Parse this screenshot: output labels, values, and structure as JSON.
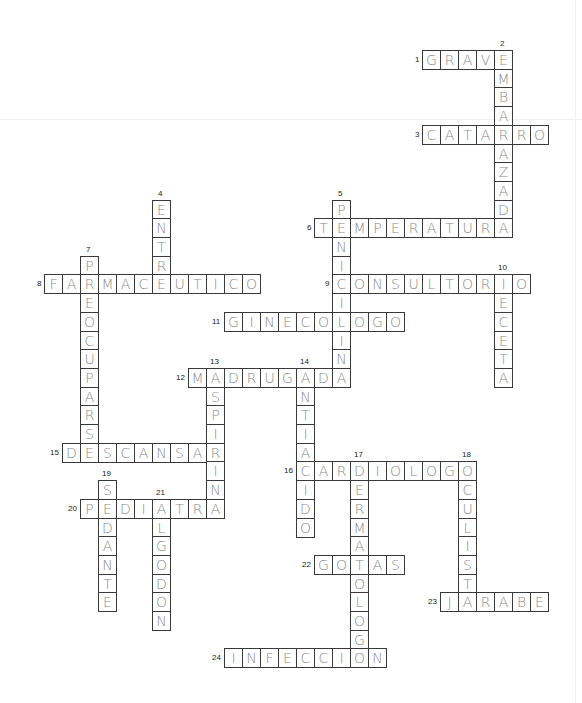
{
  "puzzle": {
    "title": "Crossword",
    "grid": {
      "origin_x": 44,
      "origin_y": 50,
      "cell_w": 18,
      "cell_h": 18.7
    },
    "words": [
      {
        "number": 1,
        "direction": "across",
        "row": 0,
        "col": 21,
        "answer": "GRAVE"
      },
      {
        "number": 2,
        "direction": "down",
        "row": 0,
        "col": 25,
        "answer": "EMBARAZADA"
      },
      {
        "number": 3,
        "direction": "across",
        "row": 4,
        "col": 21,
        "answer": "CATARRO"
      },
      {
        "number": 4,
        "direction": "down",
        "row": 8,
        "col": 6,
        "answer": "ENTRE"
      },
      {
        "number": 5,
        "direction": "down",
        "row": 8,
        "col": 16,
        "answer": "PENICILINA"
      },
      {
        "number": 6,
        "direction": "across",
        "row": 9,
        "col": 15,
        "answer": "TEMPERATURA"
      },
      {
        "number": 7,
        "direction": "down",
        "row": 11,
        "col": 2,
        "answer": "PREOCUPARSE"
      },
      {
        "number": 8,
        "direction": "across",
        "row": 12,
        "col": 0,
        "answer": "FARMACEUTICO"
      },
      {
        "number": 9,
        "direction": "across",
        "row": 12,
        "col": 16,
        "answer": "CONSULTORIO"
      },
      {
        "number": 10,
        "direction": "down",
        "row": 12,
        "col": 25,
        "answer": "RECETA"
      },
      {
        "number": 11,
        "direction": "across",
        "row": 14,
        "col": 10,
        "answer": "GINECOLOGO"
      },
      {
        "number": 12,
        "direction": "across",
        "row": 17,
        "col": 8,
        "answer": "MADRUGADA"
      },
      {
        "number": 13,
        "direction": "down",
        "row": 17,
        "col": 9,
        "answer": "ASPIRINA"
      },
      {
        "number": 14,
        "direction": "down",
        "row": 17,
        "col": 14,
        "answer": "ANTIACIDO"
      },
      {
        "number": 15,
        "direction": "across",
        "row": 21,
        "col": 1,
        "answer": "DESCANSAR"
      },
      {
        "number": 16,
        "direction": "across",
        "row": 22,
        "col": 14,
        "answer": "CARDIOLOGO"
      },
      {
        "number": 17,
        "direction": "down",
        "row": 22,
        "col": 17,
        "answer": "DERMATOLOGO"
      },
      {
        "number": 18,
        "direction": "down",
        "row": 22,
        "col": 23,
        "answer": "OCULISTA"
      },
      {
        "number": 19,
        "direction": "down",
        "row": 23,
        "col": 3,
        "answer": "SEDANTE"
      },
      {
        "number": 20,
        "direction": "across",
        "row": 24,
        "col": 2,
        "answer": "PEDIATRA"
      },
      {
        "number": 21,
        "direction": "down",
        "row": 24,
        "col": 6,
        "answer": "ALGODON"
      },
      {
        "number": 22,
        "direction": "across",
        "row": 27,
        "col": 15,
        "answer": "GOTAS"
      },
      {
        "number": 23,
        "direction": "across",
        "row": 29,
        "col": 22,
        "answer": "JARABE"
      },
      {
        "number": 24,
        "direction": "across",
        "row": 32,
        "col": 10,
        "answer": "INFECCION"
      }
    ]
  }
}
